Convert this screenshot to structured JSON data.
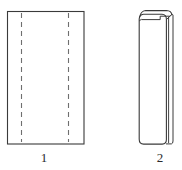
{
  "plate": {
    "width": 182,
    "height": 170,
    "background_color": "#ffffff",
    "stroke_color": "#3a3a3a",
    "dashed_stroke_color": "#6f6f6f",
    "label_color": "#2b2b2b",
    "description": "Two-part technical line drawing: an unfolded flat sheet with two vertical dashed fold lines, and the resulting folded narrow form."
  },
  "figures": [
    {
      "id": "figure-1",
      "label": "1",
      "name": "unfolded-sheet",
      "type": "rectangle-with-fold-lines",
      "outline": {
        "x": 7,
        "y": 11,
        "width": 77,
        "height": 133,
        "stroke_width": 1.1
      },
      "fold_lines": [
        {
          "name": "left-fold-line",
          "x": 21,
          "y_start": 13,
          "y_end": 142,
          "style": "dashed"
        },
        {
          "name": "right-fold-line",
          "x": 68,
          "y_start": 13,
          "y_end": 142,
          "style": "dashed"
        }
      ],
      "dash_pattern": "5 4",
      "label_position": {
        "x": 34,
        "y": 151
      }
    },
    {
      "id": "figure-2",
      "label": "2",
      "name": "folded-form",
      "type": "folded-panel",
      "front_panel": {
        "x": 139,
        "y": 14,
        "width": 27,
        "height": 130,
        "corner_radius_top": 4,
        "corner_radius_bottom": 5,
        "stroke_width": 1.1
      },
      "back_flap": {
        "name": "back-flap-edge",
        "x": 166,
        "y": 13,
        "width": 6,
        "height": 131,
        "stroke_width": 1.1
      },
      "top_fold": {
        "name": "rounded-top-fold",
        "description": "rounded fold at top running right then stepping down into inner crease",
        "crease_y": 20,
        "stroke_width": 1.0
      },
      "label_position": {
        "x": 150,
        "y": 151
      }
    }
  ],
  "labels": {
    "figure_1": "1",
    "figure_2": "2"
  }
}
